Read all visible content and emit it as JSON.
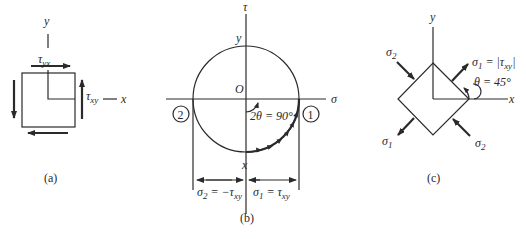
{
  "figure": {
    "panel_a": {
      "caption": "(a)",
      "axis_y_label": "y",
      "axis_x_label": "x",
      "top_shear_label": "τ",
      "top_shear_sub": "yx",
      "right_shear_label": "τ",
      "right_shear_sub": "xy"
    },
    "panel_b": {
      "caption": "(b)",
      "tau_axis_label": "τ",
      "sigma_axis_label": "σ",
      "origin_label": "O",
      "point_y_label": "y",
      "point_x_label": "x",
      "angle_label": "2θ = 90°",
      "point_1_label": "1",
      "point_2_label": "2",
      "sigma2_label": "σ",
      "sigma2_sub": "2",
      "sigma2_eq": " = −τ",
      "sigma2_eq_sub": "xy",
      "sigma1_label": "σ",
      "sigma1_sub": "1",
      "sigma1_eq": " = τ",
      "sigma1_eq_sub": "xy"
    },
    "panel_c": {
      "caption": "(c)",
      "axis_y_label": "y",
      "axis_x_label": "x",
      "sigma1_top_label": "σ",
      "sigma1_top_sub": "1",
      "sigma1_top_eq": " = |τ",
      "sigma1_top_eq_sub": "xy",
      "sigma1_top_end": "|",
      "angle_label": "θ = 45°",
      "sigma2_top_label": "σ",
      "sigma2_top_sub": "2",
      "sigma1_bottom_label": "σ",
      "sigma1_bottom_sub": "1",
      "sigma2_bottom_label": "σ",
      "sigma2_bottom_sub": "2"
    }
  }
}
